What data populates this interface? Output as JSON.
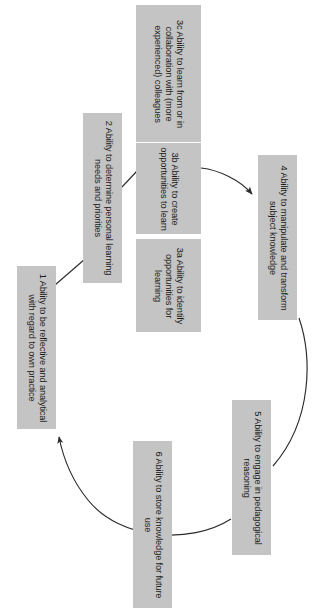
{
  "diagram": {
    "orientation": "rotated-90-clockwise",
    "style": {
      "node_fill": "#c4c4c4",
      "node_text": "#1b1b1b",
      "link_color": "#2b2b2b",
      "background": "#ffffff"
    },
    "nodes": [
      {
        "id": "1",
        "label": "1 Ability to be reflective and analytical with regard to own practice"
      },
      {
        "id": "2",
        "label": "2 Ability to determine personal learning needs and priorities"
      },
      {
        "id": "3a",
        "label": "3a Ability to identify opportunities for learning"
      },
      {
        "id": "3b",
        "label": "3b Ability to create opportunities to learn"
      },
      {
        "id": "3c",
        "label": "3c Ability to learn from or in collaboration with (more experienced) colleagues"
      },
      {
        "id": "4",
        "label": "4 Ability to manipulate and transform subject knowledge"
      },
      {
        "id": "5",
        "label": "5 Ability to engage in pedagogical reasoning"
      },
      {
        "id": "6",
        "label": "6 Ability to store knowledge for future use"
      }
    ],
    "links": [
      {
        "from": "1",
        "to": "2",
        "arrow": false
      },
      {
        "from": "2",
        "to": "3",
        "arrow": false
      },
      {
        "from": "3",
        "to": "4",
        "arrow": true
      },
      {
        "from": "4",
        "to": "5",
        "arrow": false
      },
      {
        "from": "5",
        "to": "1",
        "arrow": true
      }
    ]
  }
}
